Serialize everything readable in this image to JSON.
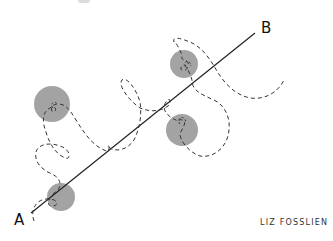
{
  "diagram": {
    "labels": {
      "start": "A",
      "end": "B"
    },
    "signature": "LIZ FOSSLIEN",
    "colors": {
      "line": "#222222",
      "path": "#333333",
      "obstacle": "#a3a3a3",
      "background": "#ffffff"
    },
    "straight_line": {
      "from": [
        31,
        213
      ],
      "to": [
        255,
        33
      ]
    },
    "obstacles": [
      {
        "cx": 52,
        "cy": 104,
        "r": 18
      },
      {
        "cx": 61,
        "cy": 197,
        "r": 14
      },
      {
        "cx": 184,
        "cy": 64,
        "r": 14
      },
      {
        "cx": 182,
        "cy": 130,
        "r": 16
      }
    ],
    "path_style": "dashed wandering path"
  }
}
